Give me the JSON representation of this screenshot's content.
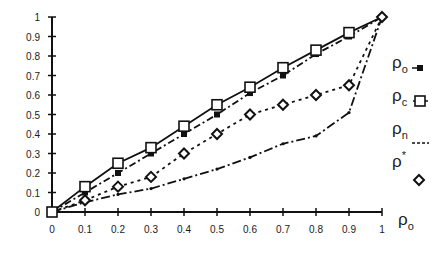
{
  "chart_data": {
    "type": "line",
    "title": "",
    "xlabel": "ρo",
    "ylabel": "",
    "xlim": [
      0,
      1
    ],
    "ylim": [
      0,
      1
    ],
    "grid": false,
    "legend_position": "right",
    "x": [
      0,
      0.1,
      0.2,
      0.3,
      0.4,
      0.5,
      0.6,
      0.7,
      0.8,
      0.9,
      1
    ],
    "x_tick_labels": [
      "0",
      "0.1",
      "0.2",
      "0.3",
      "0.4",
      "0.5",
      "0.6",
      "0.7",
      "0.8",
      "0.9",
      "1"
    ],
    "y_tick_labels": [
      "0",
      "0.1",
      "0.2",
      "0.3",
      "0.4",
      "0.5",
      "0.6",
      "0.7",
      "0.8",
      "0.9",
      "1"
    ],
    "series": [
      {
        "name": "ρo",
        "base": "ρ",
        "sub": "o",
        "sup": "",
        "style": "dash-dot",
        "marker": "filled-square",
        "values": [
          0,
          0.1,
          0.2,
          0.3,
          0.4,
          0.5,
          0.61,
          0.7,
          0.81,
          0.9,
          1.0
        ]
      },
      {
        "name": "ρc",
        "base": "ρ",
        "sub": "c",
        "sup": "",
        "style": "solid",
        "marker": "open-square",
        "values": [
          0,
          0.13,
          0.25,
          0.33,
          0.44,
          0.55,
          0.64,
          0.74,
          0.83,
          0.92,
          1.0
        ]
      },
      {
        "name": "ρn",
        "base": "ρ",
        "sub": "n",
        "sup": "",
        "style": "dash-dot-small",
        "marker": "dot",
        "values": [
          0,
          0.05,
          0.09,
          0.12,
          0.17,
          0.22,
          0.28,
          0.35,
          0.39,
          0.51,
          1.0
        ]
      },
      {
        "name": "ρ*",
        "base": "ρ",
        "sub": "",
        "sup": "*",
        "style": "dotted",
        "marker": "open-diamond",
        "values": [
          0,
          0.06,
          0.13,
          0.18,
          0.3,
          0.4,
          0.5,
          0.55,
          0.6,
          0.65,
          1.0
        ]
      }
    ]
  }
}
